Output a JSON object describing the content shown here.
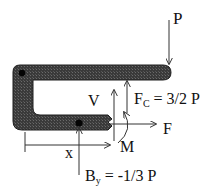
{
  "diagram": {
    "type": "free-body-diagram",
    "labels": {
      "load": "P",
      "shear": "V",
      "normal": "F",
      "moment": "M",
      "position": "x",
      "fc_main": "F",
      "fc_sub": "C",
      "fc_value": " = 3/2 P",
      "by_main": "B",
      "by_sub": "y",
      "by_value": " = -1/3 P"
    },
    "colors": {
      "member": "#3a3a3a",
      "member_edge": "#1e1e1e",
      "arrow": "#333333",
      "pin": "#050505",
      "text": "#111111",
      "background": "#ffffff"
    }
  }
}
